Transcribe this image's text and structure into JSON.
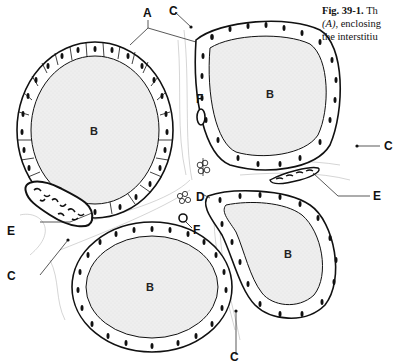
{
  "caption": {
    "line1_bold": "Fig. 39-1.",
    "line1_rest": " Th",
    "line2_italic": "(A)",
    "line2_rest": ", enclosing",
    "line3": "the interstitiu"
  },
  "labels": {
    "A": "A",
    "B": "B",
    "C": "C",
    "D": "D",
    "E": "E",
    "F": "F"
  },
  "structures": [
    {
      "label": "A",
      "meaning": "follicular epithelium"
    },
    {
      "label": "B",
      "meaning": "colloid (follicle lumen)",
      "count": 4
    },
    {
      "label": "C",
      "meaning": "connective tissue cell",
      "count": 4
    },
    {
      "label": "D",
      "meaning": "parafollicular cells"
    },
    {
      "label": "E",
      "meaning": "capillary with blood cells",
      "count": 2
    },
    {
      "label": "F",
      "meaning": "small vessel",
      "count": 2
    }
  ],
  "colors": {
    "ink": "#111111",
    "colloid": "#ececec",
    "cell_fill": "#ffffff",
    "background": "#ffffff"
  }
}
